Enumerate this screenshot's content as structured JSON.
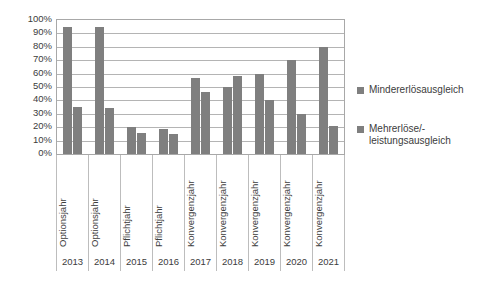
{
  "chart_data": {
    "type": "bar",
    "title": "",
    "xlabel": "",
    "ylabel": "",
    "ylim": [
      0,
      100
    ],
    "grid": true,
    "legend_position": "right",
    "categories": [
      "2013",
      "2014",
      "2015",
      "2016",
      "2017",
      "2018",
      "2019",
      "2020",
      "2021"
    ],
    "category_types": [
      "Optionsjahr",
      "Optionsjahr",
      "Pflichtjahr",
      "Pflichtjahr",
      "Konvergenzjahr",
      "Konvergenzjahr",
      "Konvergenzjahr",
      "Konvergenzjahr",
      "Konvergenzjahr"
    ],
    "series": [
      {
        "name": "Mindererlösausgleich",
        "color": "#7f7f7f",
        "values": [
          95,
          95,
          20,
          19,
          57,
          50,
          60,
          70,
          80
        ]
      },
      {
        "name": "Mehrerlöse/-leistungsausgleich",
        "color": "#7f7f7f",
        "values": [
          35,
          34,
          16,
          15,
          46,
          58,
          40,
          30,
          21
        ]
      }
    ],
    "y_ticks": [
      "100%",
      "90%",
      "80%",
      "70%",
      "60%",
      "50%",
      "40%",
      "30%",
      "20%",
      "10%",
      "0%"
    ],
    "y_tick_values": [
      100,
      90,
      80,
      70,
      60,
      50,
      40,
      30,
      20,
      10,
      0
    ]
  },
  "legend": {
    "entries": [
      {
        "label": "Mindererlösausgleich"
      },
      {
        "label": "Mehrerlöse/-\nleistungsausgleich"
      }
    ]
  },
  "colors": {
    "bar": "#7f7f7f",
    "gridline": "#b4b4b4",
    "axis": "#a8a8a8",
    "text": "#3c3c3c"
  }
}
